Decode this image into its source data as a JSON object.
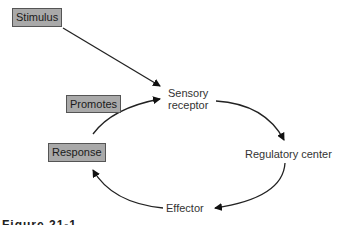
{
  "diagram": {
    "boxes": {
      "stimulus": "Stimulus",
      "promotes": "Promotes",
      "response": "Response"
    },
    "nodes": {
      "sensory_receptor_line1": "Sensory",
      "sensory_receptor_line2": "receptor",
      "regulatory_center": "Regulatory center",
      "effector": "Effector"
    },
    "edges": [
      {
        "from": "Stimulus",
        "to": "Sensory receptor"
      },
      {
        "from": "Sensory receptor",
        "to": "Regulatory center"
      },
      {
        "from": "Regulatory center",
        "to": "Effector"
      },
      {
        "from": "Effector",
        "to": "Response"
      },
      {
        "from": "Response",
        "to": "Sensory receptor",
        "label": "Promotes"
      }
    ],
    "caption": "Figure 21-1"
  },
  "colors": {
    "box_fill": "#a9a9a9",
    "arrow": "#111111"
  }
}
